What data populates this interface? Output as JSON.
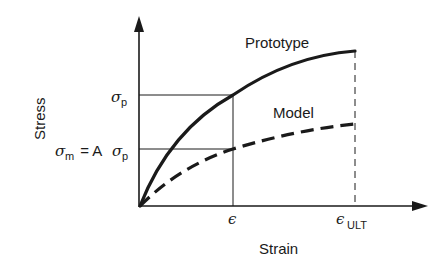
{
  "diagram": {
    "axes": {
      "y_label": "Stress",
      "x_label": "Strain"
    },
    "curves": [
      {
        "name": "Prototype",
        "label": "Prototype",
        "style": "solid"
      },
      {
        "name": "Model",
        "label": "Model",
        "style": "dashed"
      }
    ],
    "y_ticks": {
      "sigma_p": {
        "symbol": "σ",
        "sub": "p"
      },
      "sigma_m": {
        "symbol": "σ",
        "sub": "m",
        "eq": " = A",
        "symbol2": "σ",
        "sub2": "p"
      }
    },
    "x_ticks": {
      "epsilon": {
        "symbol": "ϵ"
      },
      "epsilon_ult": {
        "symbol": "ϵ",
        "sub": "ULT"
      }
    },
    "colors": {
      "ink": "#1a1a1a",
      "background": "#ffffff"
    }
  }
}
